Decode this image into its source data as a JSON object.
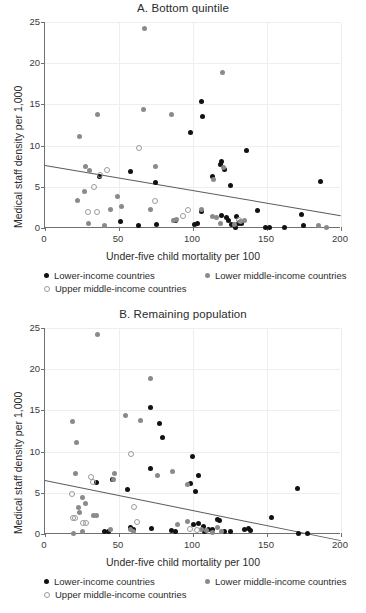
{
  "figure": {
    "x_axis_title": "Under-five child mortality per 100",
    "y_axis_title": "Medical staff density per 1,000"
  },
  "legend": {
    "lower_income": "Lower-income countries",
    "lower_middle_income": "Lower middle-income countries",
    "upper_middle_income": "Upper middle-income countries"
  },
  "colors": {
    "lower_income": "#111111",
    "lower_middle_income": "#8a8a8a",
    "upper_middle_income": "#9a9a9a",
    "trendline": "#5c5c5c",
    "grid": "#eceff1",
    "axis": "#6f6f6f"
  },
  "chart_data": [
    {
      "type": "scatter",
      "title": "A. Bottom quintile",
      "xlabel": "Under-five child mortality per 100",
      "ylabel": "Medical staff density per 1,000",
      "xlim": [
        0,
        200
      ],
      "ylim": [
        0,
        25
      ],
      "xticks": [
        0,
        50,
        100,
        150,
        200
      ],
      "yticks": [
        0,
        5,
        10,
        15,
        20,
        25
      ],
      "grid": true,
      "legend_position": "below-axis",
      "trendline": {
        "x0": 0,
        "y0": 7.6,
        "x1": 200,
        "y1": 1.5
      },
      "series": [
        {
          "name": "Lower-income countries",
          "color": "#111111",
          "marker": "filled-circle",
          "points": [
            [
              36.5,
              6.2
            ],
            [
              57.5,
              6.8
            ],
            [
              74.5,
              5.5
            ],
            [
              98.5,
              11.6
            ],
            [
              105.5,
              15.35
            ],
            [
              106.5,
              13.5
            ],
            [
              119.5,
              8.1
            ],
            [
              118.5,
              7.7
            ],
            [
              113.5,
              6.3
            ],
            [
              121.5,
              7.1
            ],
            [
              125.5,
              5.2
            ],
            [
              136.0,
              9.4
            ],
            [
              186.0,
              5.65
            ],
            [
              105.5,
              2.05
            ],
            [
              143.5,
              2.1
            ],
            [
              173.0,
              1.65
            ],
            [
              119.5,
              1.5
            ],
            [
              122.5,
              1.25
            ],
            [
              124.0,
              0.85
            ],
            [
              129.5,
              1.35
            ],
            [
              126.0,
              0.45
            ],
            [
              130.5,
              0.5
            ],
            [
              133.0,
              0.55
            ],
            [
              128.5,
              0.1
            ],
            [
              103.0,
              0.55
            ],
            [
              101.0,
              0.4
            ],
            [
              88.5,
              0.95
            ],
            [
              87.5,
              0.85
            ],
            [
              51.0,
              0.75
            ],
            [
              63.5,
              0.35
            ],
            [
              75.0,
              0.4
            ],
            [
              149.0,
              0.1
            ],
            [
              151.5,
              0.1
            ],
            [
              162.0,
              0.1
            ],
            [
              174.5,
              0.35
            ],
            [
              131.5,
              0.7
            ]
          ]
        },
        {
          "name": "Lower middle-income countries",
          "color": "#8a8a8a",
          "marker": "filled-circle",
          "points": [
            [
              67.5,
              24.2
            ],
            [
              120.0,
              18.9
            ],
            [
              35.5,
              13.75
            ],
            [
              66.5,
              14.35
            ],
            [
              85.5,
              13.75
            ],
            [
              23.5,
              11.05
            ],
            [
              27.5,
              7.45
            ],
            [
              30.0,
              7.0
            ],
            [
              74.5,
              7.45
            ],
            [
              120.5,
              7.35
            ],
            [
              114.0,
              5.9
            ],
            [
              22.0,
              3.3
            ],
            [
              26.5,
              4.45
            ],
            [
              49.0,
              3.85
            ],
            [
              44.5,
              2.2
            ],
            [
              52.0,
              2.6
            ],
            [
              71.5,
              2.3
            ],
            [
              106.0,
              2.25
            ],
            [
              113.5,
              1.45
            ],
            [
              116.0,
              1.3
            ],
            [
              134.5,
              0.9
            ],
            [
              29.5,
              0.55
            ],
            [
              40.5,
              0.3
            ],
            [
              86.5,
              0.85
            ],
            [
              89.0,
              1.0
            ],
            [
              118.5,
              0.5
            ],
            [
              128.0,
              0.45
            ],
            [
              184.5,
              0.3
            ],
            [
              190.0,
              0.05
            ],
            [
              132.0,
              0.75
            ]
          ]
        },
        {
          "name": "Upper middle-income countries",
          "color": "#9a9a9a",
          "marker": "open-circle",
          "points": [
            [
              63.5,
              9.8
            ],
            [
              41.5,
              7.05
            ],
            [
              37.0,
              6.45
            ],
            [
              32.5,
              5.0
            ],
            [
              74.0,
              3.35
            ],
            [
              28.5,
              2.0
            ],
            [
              35.0,
              2.05
            ],
            [
              93.0,
              1.5
            ],
            [
              96.5,
              2.2
            ],
            [
              130.5,
              1.0
            ]
          ]
        }
      ]
    },
    {
      "type": "scatter",
      "title": "B. Remaining population",
      "xlabel": "Under-five child mortality per 100",
      "ylabel": "Medical staff density per 1,000",
      "xlim": [
        0,
        200
      ],
      "ylim": [
        0,
        25
      ],
      "xticks": [
        0,
        50,
        100,
        150,
        200
      ],
      "yticks": [
        0,
        5,
        10,
        15,
        20,
        25
      ],
      "grid": true,
      "legend_position": "below-axis",
      "trendline": {
        "x0": 0,
        "y0": 6.5,
        "x1": 200,
        "y1": -0.8
      },
      "series": [
        {
          "name": "Lower-income countries",
          "color": "#111111",
          "marker": "filled-circle",
          "points": [
            [
              71.5,
              15.35
            ],
            [
              77.5,
              13.45
            ],
            [
              79.5,
              11.7
            ],
            [
              99.5,
              9.4
            ],
            [
              71.0,
              8.0
            ],
            [
              104.0,
              7.1
            ],
            [
              45.5,
              6.65
            ],
            [
              34.5,
              6.2
            ],
            [
              98.5,
              6.1
            ],
            [
              101.5,
              5.1
            ],
            [
              170.5,
              5.5
            ],
            [
              55.5,
              5.4
            ],
            [
              153.0,
              2.05
            ],
            [
              116.5,
              1.75
            ],
            [
              118.0,
              1.6
            ],
            [
              103.5,
              1.25
            ],
            [
              100.5,
              1.1
            ],
            [
              107.0,
              0.85
            ],
            [
              110.5,
              0.55
            ],
            [
              113.0,
              0.5
            ],
            [
              121.5,
              0.3
            ],
            [
              125.0,
              0.3
            ],
            [
              135.0,
              0.5
            ],
            [
              137.5,
              0.7
            ],
            [
              139.0,
              0.45
            ],
            [
              88.5,
              0.35
            ],
            [
              85.5,
              0.45
            ],
            [
              72.0,
              0.65
            ],
            [
              57.5,
              0.75
            ],
            [
              40.5,
              0.3
            ],
            [
              43.0,
              0.25
            ],
            [
              171.5,
              0.1
            ],
            [
              177.5,
              0.1
            ],
            [
              108.0,
              0.25
            ],
            [
              60.0,
              0.5
            ]
          ]
        },
        {
          "name": "Lower middle-income countries",
          "color": "#8a8a8a",
          "marker": "filled-circle",
          "points": [
            [
              35.5,
              24.2
            ],
            [
              71.5,
              18.9
            ],
            [
              54.5,
              14.35
            ],
            [
              18.5,
              13.7
            ],
            [
              64.5,
              13.8
            ],
            [
              21.0,
              11.1
            ],
            [
              86.0,
              7.55
            ],
            [
              20.5,
              7.3
            ],
            [
              47.0,
              7.3
            ],
            [
              76.0,
              7.15
            ],
            [
              96.5,
              6.05
            ],
            [
              46.5,
              6.6
            ],
            [
              25.5,
              4.4
            ],
            [
              27.5,
              3.75
            ],
            [
              22.5,
              3.2
            ],
            [
              23.0,
              2.55
            ],
            [
              33.0,
              2.3
            ],
            [
              35.0,
              2.2
            ],
            [
              96.0,
              1.55
            ],
            [
              89.5,
              1.1
            ],
            [
              58.0,
              0.55
            ],
            [
              44.0,
              0.5
            ],
            [
              25.0,
              0.3
            ],
            [
              105.5,
              0.55
            ],
            [
              109.0,
              0.45
            ],
            [
              116.5,
              0.75
            ],
            [
              119.5,
              0.3
            ],
            [
              113.5,
              0.2
            ],
            [
              19.0,
              0.05
            ],
            [
              59.5,
              0.35
            ]
          ]
        },
        {
          "name": "Upper middle-income countries",
          "color": "#9a9a9a",
          "marker": "open-circle",
          "points": [
            [
              57.5,
              9.75
            ],
            [
              18.0,
              4.9
            ],
            [
              30.5,
              7.0
            ],
            [
              32.0,
              6.4
            ],
            [
              59.5,
              3.35
            ],
            [
              18.5,
              2.0
            ],
            [
              20.0,
              1.95
            ],
            [
              25.5,
              1.35
            ],
            [
              27.5,
              1.4
            ],
            [
              61.5,
              1.55
            ],
            [
              97.5,
              0.65
            ],
            [
              102.5,
              0.55
            ]
          ]
        }
      ]
    }
  ]
}
